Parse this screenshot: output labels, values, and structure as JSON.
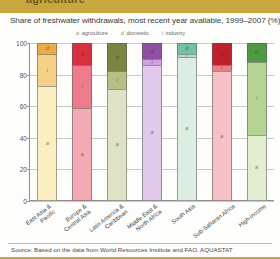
{
  "banner": {
    "label": "agriculture"
  },
  "title": "Share of freshwater withdrawals, most recent year available, 1999–2007 (%)",
  "legend": [
    {
      "key": "a",
      "label": "agriculture"
    },
    {
      "key": "d",
      "label": "domestic"
    },
    {
      "key": "i",
      "label": "industry"
    }
  ],
  "source": "Source: Based on the data from World Resources Institute and FAO, AQUASTAT",
  "chart_data": {
    "type": "bar",
    "stacked": true,
    "title": "Share of freshwater withdrawals, most recent year available, 1999–2007 (%)",
    "xlabel": "",
    "ylabel": "",
    "ylim": [
      0,
      100
    ],
    "yticks": [
      0,
      20,
      40,
      60,
      80,
      100
    ],
    "grid": true,
    "legend_position": "top",
    "categories": [
      "East Asia & Pacific",
      "Europe & Central Asia",
      "Latin America & Caribbean",
      "Middle East & North Africa",
      "South Asia",
      "Sub-Saharan Africa",
      "High-income"
    ],
    "category_lines": [
      [
        "East Asia &",
        "Pacific"
      ],
      [
        "Europe &",
        "Central Asia"
      ],
      [
        "Latin America &",
        "Caribbean"
      ],
      [
        "Middle East &",
        "North Africa"
      ],
      [
        "South Asia"
      ],
      [
        "Sub-Saharan Africa"
      ],
      [
        "High-income"
      ]
    ],
    "series": [
      {
        "name": "agriculture",
        "key": "a",
        "values": [
          73,
          59,
          71,
          86,
          91,
          82,
          42
        ]
      },
      {
        "name": "industry",
        "key": "i",
        "values": [
          20,
          27,
          11,
          4,
          2,
          4,
          46
        ]
      },
      {
        "name": "domestic",
        "key": "d",
        "values": [
          7,
          14,
          18,
          10,
          7,
          14,
          12
        ]
      }
    ],
    "bars": [
      {
        "category": "East Asia & Pacific",
        "colors": {
          "a": "#fbeec0",
          "i": "#f5cf84",
          "d": "#edab45"
        },
        "segments": [
          {
            "key": "d",
            "label": "d",
            "value": 7
          },
          {
            "key": "i",
            "label": "i",
            "value": 20
          },
          {
            "key": "a",
            "label": "a",
            "value": 73
          }
        ]
      },
      {
        "category": "Europe & Central Asia",
        "colors": {
          "a": "#f3aab4",
          "i": "#ee7b8c",
          "d": "#d8303f"
        },
        "segments": [
          {
            "key": "d",
            "label": "d",
            "value": 14
          },
          {
            "key": "i",
            "label": "i",
            "value": 27
          },
          {
            "key": "a",
            "label": "a",
            "value": 59
          }
        ]
      },
      {
        "category": "Latin America & Caribbean",
        "colors": {
          "a": "#dfe2c4",
          "i": "#b9bf84",
          "d": "#7c8540"
        },
        "segments": [
          {
            "key": "d",
            "label": "d",
            "value": 18
          },
          {
            "key": "i",
            "label": "i",
            "value": 11
          },
          {
            "key": "a",
            "label": "a",
            "value": 71
          }
        ]
      },
      {
        "category": "Middle East & North Africa",
        "colors": {
          "a": "#e2c8ea",
          "i": "#cfa4de",
          "d": "#8e4fa5"
        },
        "segments": [
          {
            "key": "d",
            "label": "d",
            "value": 10
          },
          {
            "key": "i",
            "label": "i",
            "value": 4
          },
          {
            "key": "a",
            "label": "a",
            "value": 86
          }
        ]
      },
      {
        "category": "South Asia",
        "colors": {
          "a": "#daeee2",
          "i": "#b5ddca",
          "d": "#74c2a4"
        },
        "segments": [
          {
            "key": "d",
            "label": "d",
            "value": 7
          },
          {
            "key": "i",
            "label": "i",
            "value": 2
          },
          {
            "key": "a",
            "label": "a",
            "value": 91
          }
        ]
      },
      {
        "category": "Sub-Saharan Africa",
        "colors": {
          "a": "#f4c2c6",
          "i": "#e8808e",
          "d": "#c02128"
        },
        "segments": [
          {
            "key": "d",
            "label": "d",
            "value": 14
          },
          {
            "key": "i",
            "label": "i",
            "value": 4
          },
          {
            "key": "a",
            "label": "a",
            "value": 82
          }
        ]
      },
      {
        "category": "High-income",
        "colors": {
          "a": "#e2eed0",
          "i": "#b4d392",
          "d": "#4f9b41"
        },
        "segments": [
          {
            "key": "d",
            "label": "d",
            "value": 12
          },
          {
            "key": "i",
            "label": "i",
            "value": 46
          },
          {
            "key": "a",
            "label": "a",
            "value": 42
          }
        ]
      }
    ]
  }
}
